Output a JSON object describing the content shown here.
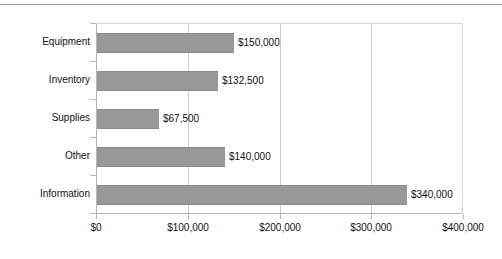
{
  "chart_data": {
    "type": "bar",
    "orientation": "horizontal",
    "title": "",
    "subtitle": "",
    "xlabel": "",
    "ylabel": "",
    "categories": [
      "Equipment",
      "Inventory",
      "Supplies",
      "Other",
      "Information"
    ],
    "values": [
      150000,
      132500,
      67500,
      140000,
      340000
    ],
    "data_labels": [
      "$150,000",
      "$132,500",
      "$67,500",
      "$140,000",
      "$340,000"
    ],
    "xlim": [
      0,
      400000
    ],
    "xticks": [
      0,
      100000,
      200000,
      300000,
      400000
    ],
    "xtick_labels": [
      "$0",
      "$100,000",
      "$200,000",
      "$300,000",
      "$400,000"
    ],
    "grid": "vertical",
    "legend": "none",
    "bar_color": "#989898",
    "bar_edge_color": "#8a8a8a",
    "gridline_color": "#cfcfcf",
    "axis_color": "#b5b5b5",
    "text_color": "#111111",
    "background": "#ffffff"
  }
}
